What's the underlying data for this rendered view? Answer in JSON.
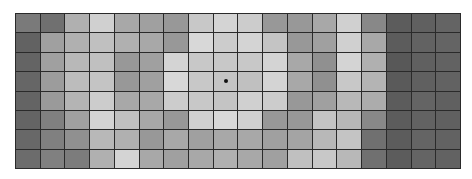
{
  "grid": {
    "rows": 8,
    "cols": 18,
    "border_color": "#2a2a2a",
    "marker": {
      "row": 3,
      "col": 8,
      "color": "#111111",
      "icon": "dot-marker-icon"
    },
    "cells": [
      [
        "#7a7a7a",
        "#707070",
        "#b0b0b0",
        "#d0d0d0",
        "#a8a8a8",
        "#a0a0a0",
        "#989898",
        "#c8c8c8",
        "#d4d4d4",
        "#cccccc",
        "#989898",
        "#989898",
        "#a8a8a8",
        "#d0d0d0",
        "#888888",
        "#5c5c5c",
        "#606060",
        "#646464"
      ],
      [
        "#626262",
        "#a0a0a0",
        "#b0b0b0",
        "#c0c0c0",
        "#b0b0b0",
        "#a8a8a8",
        "#989898",
        "#d8d8d8",
        "#cccccc",
        "#d4d4d4",
        "#c4c4c4",
        "#989898",
        "#a0a0a0",
        "#d0d0d0",
        "#a8a8a8",
        "#5c5c5c",
        "#626262",
        "#646464"
      ],
      [
        "#646464",
        "#a0a0a0",
        "#b8b8b8",
        "#c0c0c0",
        "#989898",
        "#a0a0a0",
        "#d4d4d4",
        "#c8c8c8",
        "#c8c8c8",
        "#c8c8c8",
        "#d4d4d4",
        "#a8a8a8",
        "#909090",
        "#d4d4d4",
        "#b0b0b0",
        "#585858",
        "#606060",
        "#626262"
      ],
      [
        "#666666",
        "#9c9c9c",
        "#bcbcbc",
        "#c4c4c4",
        "#989898",
        "#a0a0a0",
        "#d8d8d8",
        "#c8c8c8",
        "#c4c4c4",
        "#c0c0c0",
        "#d4d4d4",
        "#a8a8a8",
        "#909090",
        "#c8c8c8",
        "#b4b4b4",
        "#5a5a5a",
        "#606060",
        "#626262"
      ],
      [
        "#646464",
        "#9a9a9a",
        "#b4b4b4",
        "#cccccc",
        "#a8a8a8",
        "#a8a8a8",
        "#cccccc",
        "#c8c8c8",
        "#c4c4c4",
        "#d0d0d0",
        "#cccccc",
        "#989898",
        "#a0a0a0",
        "#b8b8b8",
        "#acacac",
        "#5c5c5c",
        "#646464",
        "#606060"
      ],
      [
        "#646464",
        "#808080",
        "#a0a0a0",
        "#d4d4d4",
        "#c0c0c0",
        "#a8a8a8",
        "#989898",
        "#d0d0d0",
        "#d8d8d8",
        "#d0d0d0",
        "#989898",
        "#989898",
        "#c4c4c4",
        "#b8b8b8",
        "#888888",
        "#5c5c5c",
        "#626262",
        "#606060"
      ],
      [
        "#686868",
        "#808080",
        "#909090",
        "#b8b8b8",
        "#b0b0b0",
        "#989898",
        "#a8a8a8",
        "#a0a0a0",
        "#a8a8a8",
        "#a8a8a8",
        "#a0a0a0",
        "#a4a4a4",
        "#b8b8b8",
        "#c4c4c4",
        "#707070",
        "#5c5c5c",
        "#646464",
        "#626262"
      ],
      [
        "#6c6c6c",
        "#808080",
        "#7c7c7c",
        "#b0b0b0",
        "#d4d4d4",
        "#a8a8a8",
        "#a0a0a0",
        "#a8a8a8",
        "#b0b0b0",
        "#a8a8a8",
        "#a0a0a0",
        "#c0c0c0",
        "#c8c8c8",
        "#b8b8b8",
        "#707070",
        "#5c5c5c",
        "#646464",
        "#626262"
      ]
    ]
  }
}
